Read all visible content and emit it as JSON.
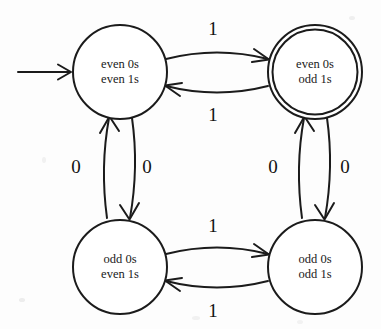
{
  "diagram": {
    "ink_color": "#1b1b1b",
    "background_color": "#fdfdfd",
    "states": [
      {
        "id": "even0-even1",
        "line1": "even 0s",
        "line2": "even 1s",
        "accepting": false,
        "start": true,
        "cx": 120,
        "cy": 72,
        "r": 47
      },
      {
        "id": "even0-odd1",
        "line1": "even 0s",
        "line2": "odd 1s",
        "accepting": true,
        "start": false,
        "cx": 315,
        "cy": 72,
        "r": 47
      },
      {
        "id": "odd0-even1",
        "line1": "odd 0s",
        "line2": "even 1s",
        "accepting": false,
        "start": false,
        "cx": 120,
        "cy": 267,
        "r": 47
      },
      {
        "id": "odd0-odd1",
        "line1": "odd 0s",
        "line2": "odd 1s",
        "accepting": false,
        "start": false,
        "cx": 315,
        "cy": 267,
        "r": 47
      }
    ],
    "transitions": [
      {
        "id": "t-top-right",
        "from": "even0-even1",
        "to": "even0-odd1",
        "symbol": "1",
        "label_x": 213,
        "label_y": 29
      },
      {
        "id": "t-top-left",
        "from": "even0-odd1",
        "to": "even0-even1",
        "symbol": "1",
        "label_x": 213,
        "label_y": 115
      },
      {
        "id": "t-left-down",
        "from": "even0-even1",
        "to": "odd0-even1",
        "symbol": "0",
        "label_x": 147,
        "label_y": 167
      },
      {
        "id": "t-left-up",
        "from": "odd0-even1",
        "to": "even0-even1",
        "symbol": "0",
        "label_x": 76,
        "label_y": 167
      },
      {
        "id": "t-right-down",
        "from": "even0-odd1",
        "to": "odd0-odd1",
        "symbol": "0",
        "label_x": 345,
        "label_y": 167
      },
      {
        "id": "t-right-up",
        "from": "odd0-odd1",
        "to": "even0-odd1",
        "symbol": "0",
        "label_x": 273,
        "label_y": 167
      },
      {
        "id": "t-bottom-right",
        "from": "odd0-even1",
        "to": "odd0-odd1",
        "symbol": "1",
        "label_x": 213,
        "label_y": 226
      },
      {
        "id": "t-bottom-left",
        "from": "odd0-odd1",
        "to": "odd0-even1",
        "symbol": "1",
        "label_x": 213,
        "label_y": 311
      }
    ],
    "start_arrow": {
      "id": "start-arrow",
      "x1": 18,
      "y1": 72,
      "x2": 71,
      "y2": 72
    }
  }
}
